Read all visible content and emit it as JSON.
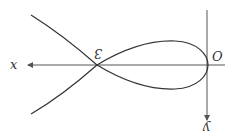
{
  "diagram": {
    "labels": {
      "x_axis": "x",
      "y_axis": "y",
      "origin": "O",
      "crossing_point": "3"
    },
    "colors": {
      "curve": "#333333",
      "axes": "#555555",
      "background": "#ffffff"
    }
  }
}
